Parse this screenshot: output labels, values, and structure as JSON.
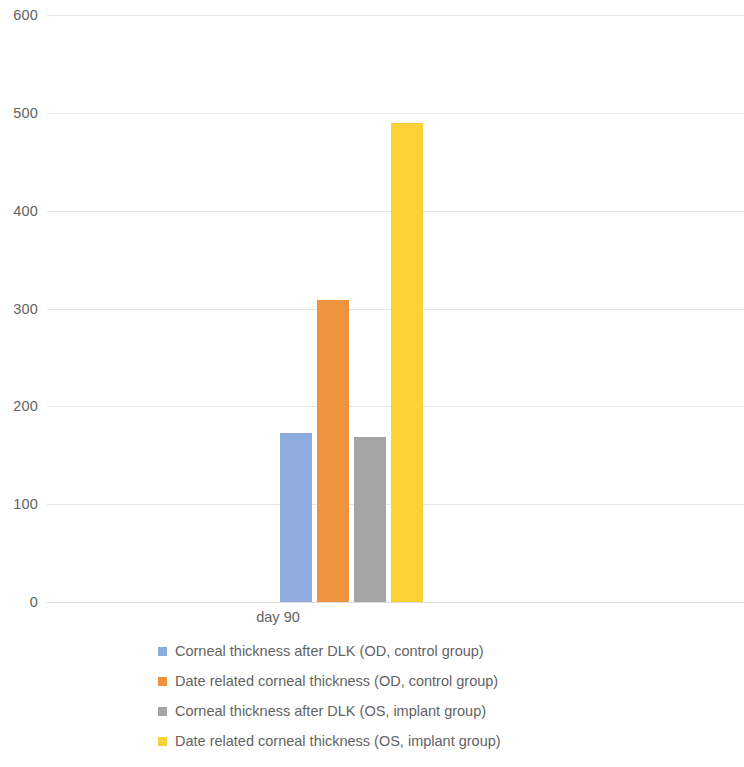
{
  "chart_data": {
    "type": "bar",
    "title": "",
    "subtitle": "",
    "xlabel": "",
    "ylabel": "",
    "categories": [
      "day 90"
    ],
    "ylim": [
      0,
      600
    ],
    "ytick_labels": [
      "600",
      "500",
      "400",
      "300",
      "200",
      "100",
      "0"
    ],
    "ytick_values": [
      600,
      500,
      400,
      300,
      200,
      100,
      0
    ],
    "grid": true,
    "legend_position": "bottom",
    "series": [
      {
        "name": "Corneal thickness after DLK (OD, control group)",
        "color": "#8FAADC",
        "values": [
          173
        ]
      },
      {
        "name": "Date related corneal thickness (OD, control group)",
        "color": "#ED943C",
        "values": [
          309
        ]
      },
      {
        "name": "Corneal thickness after DLK (OS, implant group)",
        "color": "#A5A5A5",
        "values": [
          169
        ]
      },
      {
        "name": "Date related corneal thickness (OS, implant group)",
        "color": "#FBD235",
        "values": [
          490
        ]
      }
    ]
  },
  "axis": {
    "ticks": [
      {
        "label": "600",
        "value": 600
      },
      {
        "label": "500",
        "value": 500
      },
      {
        "label": "400",
        "value": 400
      },
      {
        "label": "300",
        "value": 300
      },
      {
        "label": "200",
        "value": 200
      },
      {
        "label": "100",
        "value": 100
      },
      {
        "label": "0",
        "value": 0
      }
    ]
  },
  "category_label": "day 90",
  "legend": {
    "items": [
      {
        "label": "Corneal thickness after DLK (OD, control group)",
        "color": "#8FAADC"
      },
      {
        "label": "Date related corneal thickness (OD, control group)",
        "color": "#ED943C"
      },
      {
        "label": "Corneal thickness after DLK (OS, implant group)",
        "color": "#A5A5A5"
      },
      {
        "label": "Date related corneal thickness (OS, implant group)",
        "color": "#FBD235"
      }
    ]
  }
}
